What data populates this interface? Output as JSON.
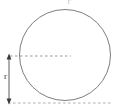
{
  "diagram": {
    "type": "geometry-circle-radius",
    "title_label": "r",
    "top_label": "r",
    "radius_label": "r",
    "colors": {
      "circle_stroke": "#6e6e6e",
      "dashed_line": "#9a9a9a",
      "arrow": "#4a4a4a",
      "label_text": "#3a3a3a",
      "faint_text": "#c8c8c8",
      "background": "#ffffff"
    },
    "geometry": {
      "circle_center_x": 65,
      "circle_center_y": 55,
      "circle_radius": 46,
      "baseline_y": 103,
      "radius_line_y": 56,
      "arrow_x": 9,
      "arrow_top_y": 56,
      "arrow_bottom_y": 103
    }
  }
}
